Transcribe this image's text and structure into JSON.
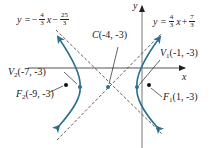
{
  "diagram": {
    "type": "hyperbola",
    "axes": {
      "x_label": "x",
      "y_label": "y"
    },
    "center": {
      "name": "C",
      "coords": "(-4, -3)",
      "x": -4,
      "y": -3
    },
    "vertices": [
      {
        "name": "V",
        "sub": "1",
        "coords": "(-1, -3)",
        "x": -1,
        "y": -3
      },
      {
        "name": "V",
        "sub": "2",
        "coords": "(-7, -3)",
        "x": -7,
        "y": -3
      }
    ],
    "foci": [
      {
        "name": "F",
        "sub": "1",
        "coords": "(1, -3)",
        "x": 1,
        "y": -3
      },
      {
        "name": "F",
        "sub": "2",
        "coords": "(-9, -3)",
        "x": -9,
        "y": -3
      }
    ],
    "asymptotes": [
      {
        "lhs": "y =",
        "sign": "−",
        "slope_num": "4",
        "slope_den": "3",
        "var": "x",
        "op": "−",
        "int_num": "25",
        "int_den": "3"
      },
      {
        "lhs": "y =",
        "sign": "",
        "slope_num": "4",
        "slope_den": "3",
        "var": "x",
        "op": "+",
        "int_num": "7",
        "int_den": "3"
      }
    ],
    "colors": {
      "curve": "#2a6f8f",
      "axis": "#555555",
      "asymptote": "#333333",
      "point": "#111111"
    }
  }
}
